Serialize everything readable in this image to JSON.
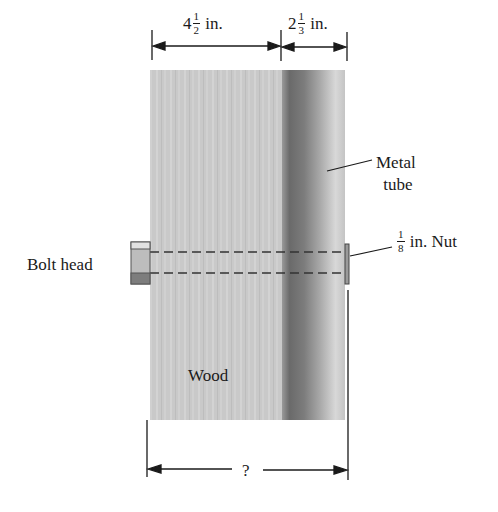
{
  "diagram": {
    "type": "bolt-through-wood-and-metal-tube",
    "dimensions": {
      "wood_width": {
        "whole": "4",
        "num": "1",
        "den": "2",
        "unit": "in."
      },
      "tube_width": {
        "whole": "2",
        "num": "1",
        "den": "3",
        "unit": "in."
      },
      "nut_thickness": {
        "num": "1",
        "den": "8",
        "unit": "in.",
        "suffix": "Nut"
      },
      "total_length": "?"
    },
    "labels": {
      "metal_line1": "Metal",
      "metal_line2": "tube",
      "bolt_head": "Bolt head",
      "wood": "Wood"
    },
    "colors": {
      "wood": "#c9c9c9",
      "tube_dark": "#6e6e6e",
      "tube_light": "#d2d2d2",
      "ink": "#1a1a1a"
    }
  }
}
